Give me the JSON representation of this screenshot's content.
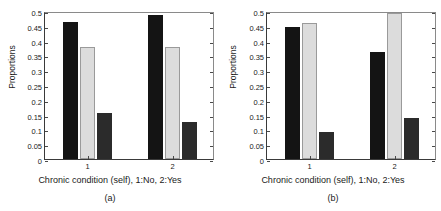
{
  "figure": {
    "background": "#ffffff",
    "panel_count": 2
  },
  "chart_data": [
    {
      "type": "bar",
      "panel": "a",
      "caption": "(a)",
      "title": "",
      "xlabel": "Chronic condition (self), 1:No, 2:Yes",
      "ylabel": "Proportions",
      "categories": [
        "1",
        "2"
      ],
      "ylim": [
        0,
        0.5
      ],
      "yticks": [
        0,
        0.05,
        0.1,
        0.15,
        0.2,
        0.25,
        0.3,
        0.35,
        0.4,
        0.45,
        0.5
      ],
      "ytick_labels": [
        "0",
        "0.05",
        "0.1",
        "0.15",
        "0.2",
        "0.25",
        "0.3",
        "0.35",
        "0.4",
        "0.45",
        "0.5"
      ],
      "grid": false,
      "legend": "none",
      "series": [
        {
          "name": "series-1",
          "color": "#141414",
          "values": [
            0.462,
            0.488
          ]
        },
        {
          "name": "series-2",
          "color": "#dcdcdc",
          "values": [
            0.38,
            0.378
          ]
        },
        {
          "name": "series-3",
          "color": "#2b2b2b",
          "values": [
            0.156,
            0.124
          ]
        }
      ]
    },
    {
      "type": "bar",
      "panel": "b",
      "caption": "(b)",
      "title": "",
      "xlabel": "Chronic condition (self), 1:No, 2:Yes",
      "ylabel": "Proportions",
      "categories": [
        "1",
        "2"
      ],
      "ylim": [
        0,
        0.5
      ],
      "yticks": [
        0,
        0.05,
        0.1,
        0.15,
        0.2,
        0.25,
        0.3,
        0.35,
        0.4,
        0.45,
        0.5
      ],
      "ytick_labels": [
        "0",
        "0.05",
        "0.1",
        "0.15",
        "0.2",
        "0.25",
        "0.3",
        "0.35",
        "0.4",
        "0.45",
        "0.5"
      ],
      "grid": false,
      "legend": "none",
      "series": [
        {
          "name": "series-1",
          "color": "#141414",
          "values": [
            0.445,
            0.362
          ]
        },
        {
          "name": "series-2",
          "color": "#dcdcdc",
          "values": [
            0.461,
            0.494
          ]
        },
        {
          "name": "series-3",
          "color": "#2b2b2b",
          "values": [
            0.091,
            0.138
          ]
        }
      ]
    }
  ]
}
